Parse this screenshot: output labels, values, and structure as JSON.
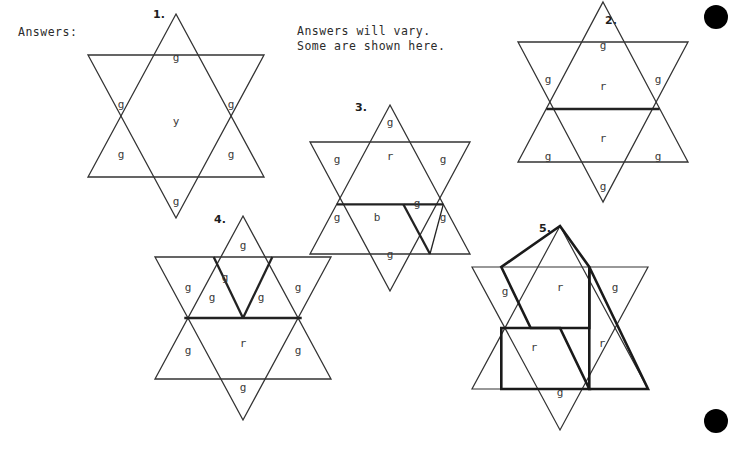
{
  "page": {
    "width": 736,
    "height": 450,
    "background": "#ffffff",
    "ink_color": "#2b2b2b"
  },
  "heading": {
    "label": "Answers:"
  },
  "note": {
    "line1": "Answers will vary.",
    "line2": "Some are shown here."
  },
  "registration_dots": [
    {
      "name": "registration-dot-top-right",
      "cx": 716,
      "cy": 17,
      "r": 12
    },
    {
      "name": "registration-dot-bottom-right",
      "cx": 716,
      "cy": 421,
      "r": 12
    }
  ],
  "color_key": {
    "g": "green",
    "r": "red",
    "y": "yellow",
    "b": "blue"
  },
  "stars": [
    {
      "id": "star-1",
      "number": "1.",
      "number_x": 153,
      "number_y": 8,
      "origin_x": 88,
      "origin_y": 14,
      "labels": [
        {
          "text": "g",
          "x": 88,
          "y": 44
        },
        {
          "text": "g",
          "x": 33,
          "y": 91
        },
        {
          "text": "g",
          "x": 143,
          "y": 91
        },
        {
          "text": "y",
          "x": 88,
          "y": 108
        },
        {
          "text": "g",
          "x": 33,
          "y": 141
        },
        {
          "text": "g",
          "x": 143,
          "y": 141
        },
        {
          "text": "g",
          "x": 88,
          "y": 188
        }
      ]
    },
    {
      "id": "star-2",
      "number": "2.",
      "number_x": 605,
      "number_y": 14,
      "origin_x": 518,
      "origin_y": 2,
      "labels": [
        {
          "text": "g",
          "x": 85,
          "y": 44
        },
        {
          "text": "g",
          "x": 30,
          "y": 78
        },
        {
          "text": "r",
          "x": 85,
          "y": 85
        },
        {
          "text": "g",
          "x": 140,
          "y": 78
        },
        {
          "text": "g",
          "x": 30,
          "y": 155
        },
        {
          "text": "r",
          "x": 85,
          "y": 137
        },
        {
          "text": "g",
          "x": 140,
          "y": 155
        },
        {
          "text": "g",
          "x": 85,
          "y": 185
        }
      ]
    },
    {
      "id": "star-3",
      "number": "3.",
      "number_x": 355,
      "number_y": 101,
      "origin_x": 310,
      "origin_y": 105,
      "labels": [
        {
          "text": "g",
          "x": 80,
          "y": 18
        },
        {
          "text": "g",
          "x": 27,
          "y": 55
        },
        {
          "text": "r",
          "x": 80,
          "y": 52
        },
        {
          "text": "g",
          "x": 133,
          "y": 55
        },
        {
          "text": "g",
          "x": 27,
          "y": 113
        },
        {
          "text": "b",
          "x": 67,
          "y": 113
        },
        {
          "text": "g",
          "x": 107,
          "y": 99
        },
        {
          "text": "g",
          "x": 133,
          "y": 113
        },
        {
          "text": "g",
          "x": 80,
          "y": 150
        }
      ]
    },
    {
      "id": "star-4",
      "number": "4.",
      "number_x": 214,
      "number_y": 213,
      "origin_x": 155,
      "origin_y": 216
    },
    {
      "id": "star-5",
      "number": "5.",
      "number_x": 539,
      "number_y": 222,
      "origin_x": 472,
      "origin_y": 226
    }
  ],
  "star4_labels": [
    {
      "text": "g",
      "x": 88,
      "y": 30
    },
    {
      "text": "g",
      "x": 33,
      "y": 72
    },
    {
      "text": "g",
      "x": 70,
      "y": 62
    },
    {
      "text": "g",
      "x": 143,
      "y": 72
    },
    {
      "text": "g",
      "x": 57,
      "y": 82
    },
    {
      "text": "g",
      "x": 106,
      "y": 82
    },
    {
      "text": "g",
      "x": 33,
      "y": 135
    },
    {
      "text": "r",
      "x": 88,
      "y": 128
    },
    {
      "text": "g",
      "x": 143,
      "y": 135
    },
    {
      "text": "g",
      "x": 88,
      "y": 172
    }
  ],
  "star5_labels": [
    {
      "text": "g",
      "x": 33,
      "y": 66
    },
    {
      "text": "r",
      "x": 88,
      "y": 62
    },
    {
      "text": "g",
      "x": 143,
      "y": 62
    },
    {
      "text": "r",
      "x": 62,
      "y": 122
    },
    {
      "text": "r",
      "x": 130,
      "y": 118
    },
    {
      "text": "g",
      "x": 88,
      "y": 167
    }
  ]
}
